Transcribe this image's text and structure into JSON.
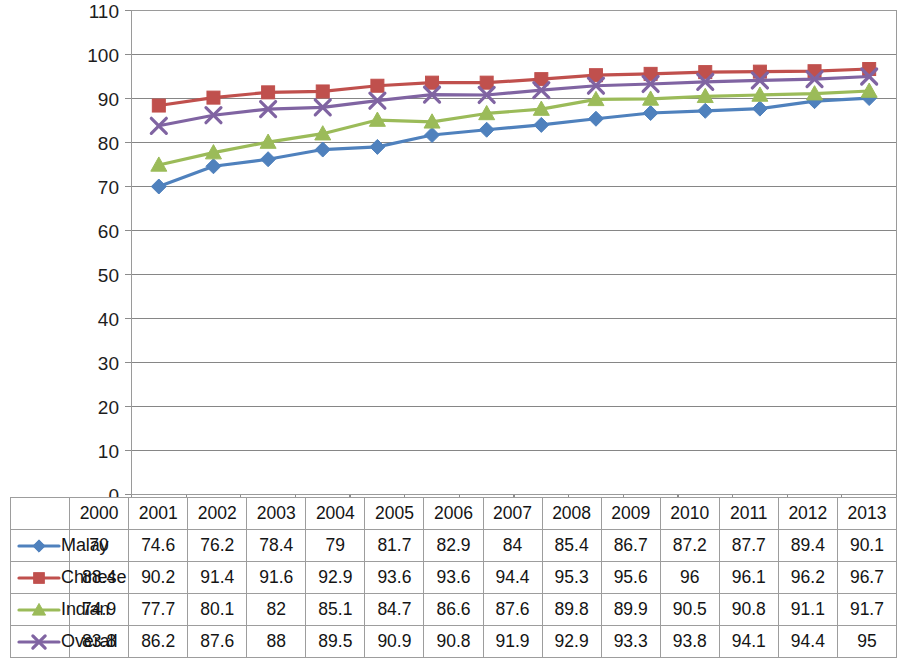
{
  "chart_data": {
    "type": "line",
    "title": "",
    "xlabel": "",
    "ylabel": "",
    "ylim": [
      0,
      110
    ],
    "ytick_step": 10,
    "yticks": [
      0,
      10,
      20,
      30,
      40,
      50,
      60,
      70,
      80,
      90,
      100,
      110
    ],
    "grid": true,
    "grid_axis": "y",
    "legend_position": "data-table-left",
    "has_data_table": true,
    "categories": [
      "2000",
      "2001",
      "2002",
      "2003",
      "2004",
      "2005",
      "2006",
      "2007",
      "2008",
      "2009",
      "2010",
      "2011",
      "2012",
      "2013"
    ],
    "series": [
      {
        "name": "Malay",
        "color": "#4F81BD",
        "marker": "diamond",
        "values": [
          70,
          74.6,
          76.2,
          78.4,
          79,
          81.7,
          82.9,
          84,
          85.4,
          86.7,
          87.2,
          87.7,
          89.4,
          90.1
        ],
        "labels": [
          "70",
          "74.6",
          "76.2",
          "78.4",
          "79",
          "81.7",
          "82.9",
          "84",
          "85.4",
          "86.7",
          "87.2",
          "87.7",
          "89.4",
          "90.1"
        ]
      },
      {
        "name": "Chinese",
        "color": "#C0504D",
        "marker": "square",
        "values": [
          88.4,
          90.2,
          91.4,
          91.6,
          92.9,
          93.6,
          93.6,
          94.4,
          95.3,
          95.6,
          96,
          96.1,
          96.2,
          96.7
        ],
        "labels": [
          "88.4",
          "90.2",
          "91.4",
          "91.6",
          "92.9",
          "93.6",
          "93.6",
          "94.4",
          "95.3",
          "95.6",
          "96",
          "96.1",
          "96.2",
          "96.7"
        ]
      },
      {
        "name": "Indian",
        "color": "#9BBB59",
        "marker": "triangle",
        "values": [
          74.9,
          77.7,
          80.1,
          82,
          85.1,
          84.7,
          86.6,
          87.6,
          89.8,
          89.9,
          90.5,
          90.8,
          91.1,
          91.7
        ],
        "labels": [
          "74.9",
          "77.7",
          "80.1",
          "82",
          "85.1",
          "84.7",
          "86.6",
          "87.6",
          "89.8",
          "89.9",
          "90.5",
          "90.8",
          "91.1",
          "91.7"
        ]
      },
      {
        "name": "Overall",
        "color": "#8064A2",
        "marker": "x",
        "values": [
          83.8,
          86.2,
          87.6,
          88,
          89.5,
          90.9,
          90.8,
          91.9,
          92.9,
          93.3,
          93.8,
          94.1,
          94.4,
          95
        ],
        "labels": [
          "83.8",
          "86.2",
          "87.6",
          "88",
          "89.5",
          "90.9",
          "90.8",
          "91.9",
          "92.9",
          "93.3",
          "93.8",
          "94.1",
          "94.4",
          "95"
        ]
      }
    ]
  },
  "table": {
    "corner_label": "",
    "column_headers": [
      "2000",
      "2001",
      "2002",
      "2003",
      "2004",
      "2005",
      "2006",
      "2007",
      "2008",
      "2009",
      "2010",
      "2011",
      "2012",
      "2013"
    ],
    "rows": [
      {
        "label": "Malay",
        "key_color": "#4F81BD",
        "marker": "diamond",
        "cells": [
          "70",
          "74.6",
          "76.2",
          "78.4",
          "79",
          "81.7",
          "82.9",
          "84",
          "85.4",
          "86.7",
          "87.2",
          "87.7",
          "89.4",
          "90.1"
        ]
      },
      {
        "label": "Chinese",
        "key_color": "#C0504D",
        "marker": "square",
        "cells": [
          "88.4",
          "90.2",
          "91.4",
          "91.6",
          "92.9",
          "93.6",
          "93.6",
          "94.4",
          "95.3",
          "95.6",
          "96",
          "96.1",
          "96.2",
          "96.7"
        ]
      },
      {
        "label": "Indian",
        "key_color": "#9BBB59",
        "marker": "triangle",
        "cells": [
          "74.9",
          "77.7",
          "80.1",
          "82",
          "85.1",
          "84.7",
          "86.6",
          "87.6",
          "89.8",
          "89.9",
          "90.5",
          "90.8",
          "91.1",
          "91.7"
        ]
      },
      {
        "label": "Overall",
        "key_color": "#8064A2",
        "marker": "x",
        "cells": [
          "83.8",
          "86.2",
          "87.6",
          "88",
          "89.5",
          "90.9",
          "90.8",
          "91.9",
          "92.9",
          "93.3",
          "93.8",
          "94.1",
          "94.4",
          "95"
        ]
      }
    ]
  },
  "axis": {
    "y_tick_labels": [
      "110",
      "100",
      "90",
      "80",
      "70",
      "60",
      "50",
      "40",
      "30",
      "20",
      "10",
      "0"
    ]
  }
}
